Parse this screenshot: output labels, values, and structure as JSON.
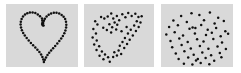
{
  "figure": {
    "background_color": "#ffffff",
    "panel_background_color": "#d9d9d9",
    "dot_color": "#101010",
    "panel_count": 3,
    "dot_radius": 1.25,
    "view_box": "0 0 72 63"
  },
  "chart_data": {
    "type": "scatter",
    "subtitle": "",
    "xlabel": "",
    "ylabel": "",
    "grid": false,
    "legend": "none",
    "xlim": [
      0,
      72
    ],
    "ylim": [
      0,
      63
    ],
    "panels": [
      {
        "name": "panel-clean",
        "label": "",
        "noise_level": 0.0,
        "point_count": 60,
        "points": [
          [
            36.0,
            14.5
          ],
          [
            34.0,
            12.2
          ],
          [
            31.8,
            10.4
          ],
          [
            29.3,
            9.1
          ],
          [
            26.6,
            8.4
          ],
          [
            23.9,
            8.4
          ],
          [
            21.3,
            9.2
          ],
          [
            19.0,
            10.6
          ],
          [
            17.0,
            12.6
          ],
          [
            15.6,
            15.0
          ],
          [
            14.8,
            17.7
          ],
          [
            14.6,
            20.6
          ],
          [
            15.0,
            23.5
          ],
          [
            15.9,
            26.3
          ],
          [
            17.2,
            29.0
          ],
          [
            18.8,
            31.6
          ],
          [
            20.7,
            34.1
          ],
          [
            22.7,
            36.5
          ],
          [
            24.9,
            38.9
          ],
          [
            27.1,
            41.2
          ],
          [
            29.3,
            43.5
          ],
          [
            31.4,
            45.8
          ],
          [
            33.4,
            48.1
          ],
          [
            35.1,
            50.5
          ],
          [
            36.4,
            53.0
          ],
          [
            37.3,
            55.6
          ],
          [
            37.9,
            57.9
          ],
          [
            38.8,
            55.8
          ],
          [
            40.0,
            53.4
          ],
          [
            41.5,
            51.1
          ],
          [
            43.2,
            48.8
          ],
          [
            45.1,
            46.5
          ],
          [
            47.1,
            44.2
          ],
          [
            49.2,
            41.9
          ],
          [
            51.3,
            39.5
          ],
          [
            53.3,
            37.1
          ],
          [
            55.2,
            34.6
          ],
          [
            56.9,
            32.0
          ],
          [
            58.3,
            29.3
          ],
          [
            59.4,
            26.5
          ],
          [
            60.1,
            23.6
          ],
          [
            60.3,
            20.7
          ],
          [
            60.0,
            17.8
          ],
          [
            59.1,
            15.1
          ],
          [
            57.6,
            12.8
          ],
          [
            55.6,
            11.0
          ],
          [
            53.2,
            9.6
          ],
          [
            50.5,
            8.8
          ],
          [
            47.8,
            8.8
          ],
          [
            45.1,
            9.4
          ],
          [
            42.7,
            10.7
          ],
          [
            40.6,
            12.5
          ],
          [
            38.9,
            14.7
          ],
          [
            37.9,
            16.8
          ],
          [
            37.2,
            19.0
          ],
          [
            36.8,
            21.2
          ],
          [
            36.5,
            18.6
          ],
          [
            36.3,
            16.6
          ],
          [
            36.1,
            20.0
          ],
          [
            37.5,
            21.6
          ]
        ]
      },
      {
        "name": "panel-medium-noise",
        "label": "",
        "noise_level": 0.5,
        "point_count": 58,
        "points": [
          [
            33.8,
            12.0
          ],
          [
            30.1,
            14.4
          ],
          [
            28.0,
            9.6
          ],
          [
            24.4,
            12.4
          ],
          [
            20.9,
            14.5
          ],
          [
            17.6,
            13.0
          ],
          [
            13.8,
            20.6
          ],
          [
            11.5,
            17.3
          ],
          [
            9.6,
            24.9
          ],
          [
            12.3,
            29.5
          ],
          [
            8.9,
            33.4
          ],
          [
            13.1,
            36.6
          ],
          [
            10.5,
            40.4
          ],
          [
            15.6,
            42.3
          ],
          [
            12.9,
            46.1
          ],
          [
            18.4,
            47.6
          ],
          [
            16.0,
            51.7
          ],
          [
            21.6,
            50.4
          ],
          [
            20.0,
            55.3
          ],
          [
            24.8,
            53.2
          ],
          [
            26.5,
            57.8
          ],
          [
            30.0,
            52.9
          ],
          [
            31.2,
            48.2
          ],
          [
            33.9,
            51.6
          ],
          [
            35.6,
            46.5
          ],
          [
            38.2,
            49.9
          ],
          [
            36.8,
            41.7
          ],
          [
            41.4,
            44.1
          ],
          [
            39.6,
            38.0
          ],
          [
            44.3,
            40.1
          ],
          [
            42.1,
            33.9
          ],
          [
            47.0,
            35.8
          ],
          [
            45.2,
            29.6
          ],
          [
            50.2,
            31.5
          ],
          [
            48.1,
            25.8
          ],
          [
            53.4,
            27.1
          ],
          [
            51.6,
            21.4
          ],
          [
            56.2,
            22.9
          ],
          [
            54.3,
            17.2
          ],
          [
            58.1,
            18.4
          ],
          [
            56.0,
            13.1
          ],
          [
            59.3,
            12.3
          ],
          [
            52.8,
            9.8
          ],
          [
            49.0,
            12.0
          ],
          [
            45.5,
            9.1
          ],
          [
            42.6,
            13.2
          ],
          [
            39.4,
            10.3
          ],
          [
            36.2,
            16.3
          ],
          [
            34.2,
            20.8
          ],
          [
            31.5,
            18.5
          ],
          [
            29.0,
            23.3
          ],
          [
            26.1,
            20.2
          ],
          [
            23.5,
            26.0
          ],
          [
            19.8,
            23.8
          ],
          [
            27.9,
            28.5
          ],
          [
            33.1,
            25.4
          ],
          [
            38.6,
            27.3
          ],
          [
            43.8,
            23.0
          ]
        ]
      },
      {
        "name": "panel-high-noise",
        "label": "",
        "noise_level": 1.0,
        "point_count": 58,
        "points": [
          [
            30.5,
            9.3
          ],
          [
            20.1,
            12.1
          ],
          [
            38.4,
            11.0
          ],
          [
            48.9,
            8.6
          ],
          [
            57.2,
            13.8
          ],
          [
            12.4,
            16.4
          ],
          [
            25.8,
            17.9
          ],
          [
            43.0,
            16.2
          ],
          [
            53.6,
            19.4
          ],
          [
            62.8,
            17.0
          ],
          [
            8.1,
            23.1
          ],
          [
            16.9,
            21.3
          ],
          [
            28.5,
            24.8
          ],
          [
            31.6,
            23.6
          ],
          [
            34.4,
            24.1
          ],
          [
            40.2,
            21.0
          ],
          [
            46.7,
            25.7
          ],
          [
            55.1,
            24.0
          ],
          [
            64.3,
            27.2
          ],
          [
            5.3,
            30.5
          ],
          [
            13.7,
            28.2
          ],
          [
            22.0,
            31.6
          ],
          [
            33.9,
            29.4
          ],
          [
            45.0,
            31.1
          ],
          [
            50.8,
            28.7
          ],
          [
            59.7,
            32.3
          ],
          [
            67.1,
            29.8
          ],
          [
            9.5,
            36.9
          ],
          [
            18.3,
            34.5
          ],
          [
            26.7,
            38.0
          ],
          [
            36.1,
            35.2
          ],
          [
            42.5,
            37.4
          ],
          [
            52.3,
            35.0
          ],
          [
            61.0,
            38.6
          ],
          [
            11.2,
            43.2
          ],
          [
            20.6,
            41.0
          ],
          [
            29.8,
            44.5
          ],
          [
            38.9,
            42.1
          ],
          [
            47.4,
            44.8
          ],
          [
            56.5,
            42.4
          ],
          [
            64.9,
            45.1
          ],
          [
            14.8,
            49.6
          ],
          [
            23.4,
            47.3
          ],
          [
            32.7,
            50.8
          ],
          [
            41.3,
            48.4
          ],
          [
            50.1,
            51.2
          ],
          [
            58.8,
            48.9
          ],
          [
            17.6,
            55.0
          ],
          [
            27.2,
            53.6
          ],
          [
            35.0,
            56.4
          ],
          [
            36.8,
            55.1
          ],
          [
            44.6,
            53.9
          ],
          [
            53.2,
            56.7
          ],
          [
            22.9,
            59.8
          ],
          [
            31.4,
            60.4
          ],
          [
            39.7,
            59.1
          ],
          [
            48.3,
            60.2
          ],
          [
            60.4,
            53.3
          ]
        ]
      }
    ]
  }
}
